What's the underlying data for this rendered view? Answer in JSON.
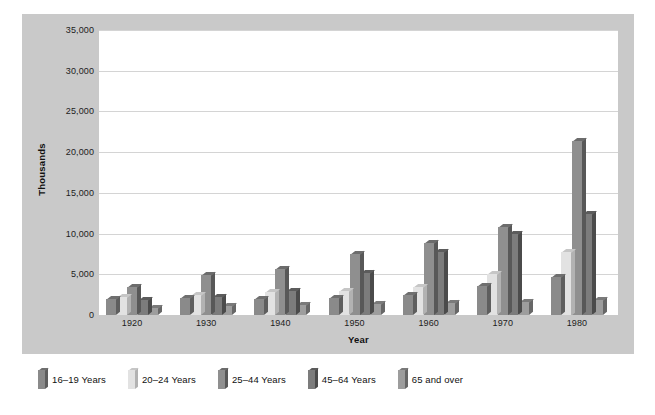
{
  "chart_data": {
    "type": "bar",
    "title": "",
    "subtitle": "",
    "xlabel": "Year",
    "ylabel": "Thousands",
    "categories": [
      "1920",
      "1930",
      "1940",
      "1950",
      "1960",
      "1970",
      "1980"
    ],
    "ylim": [
      0,
      35000
    ],
    "yticks": [
      0,
      5000,
      10000,
      15000,
      20000,
      25000,
      30000,
      35000
    ],
    "ytick_labels": [
      "0",
      "5,000",
      "10,000",
      "15,000",
      "20,000",
      "25,000",
      "30,000",
      "35,000"
    ],
    "grid": true,
    "legend_position": "bottom-left-outside",
    "style": "3d-grouped-bar",
    "series": [
      {
        "name": "16–19 Years",
        "color": "#8a8a8a",
        "top_color": "#6f6f6f",
        "side_color": "#5e5e5e",
        "values": [
          2000,
          2100,
          2000,
          2100,
          2400,
          3600,
          4700
        ]
      },
      {
        "name": "20–24 Years",
        "color": "#e2e2e2",
        "top_color": "#c6c6c6",
        "side_color": "#b2b2b2",
        "values": [
          2200,
          2500,
          2800,
          2900,
          3400,
          5000,
          7800
        ]
      },
      {
        "name": "25–44 Years",
        "color": "#8f8f8f",
        "top_color": "#6c6c6c",
        "side_color": "#585858",
        "values": [
          3400,
          4900,
          5700,
          7500,
          8800,
          10800,
          21400
        ]
      },
      {
        "name": "45–64 Years",
        "color": "#7c7c7c",
        "top_color": "#5c5c5c",
        "side_color": "#4b4b4b",
        "values": [
          1800,
          2200,
          3000,
          5100,
          7700,
          10000,
          12400
        ]
      },
      {
        "name": "65 and over",
        "color": "#9d9d9d",
        "top_color": "#7a7a7a",
        "side_color": "#676767",
        "values": [
          900,
          1100,
          1200,
          1400,
          1500,
          1600,
          1800
        ]
      }
    ]
  },
  "colors": {
    "figure_background": "#ffffff",
    "card_background": "#c9c9c9",
    "plot_background": "#ffffff",
    "gridline": "#d4d4d4",
    "axis_text": "#1c1c1c",
    "axis_title": "#111111"
  }
}
